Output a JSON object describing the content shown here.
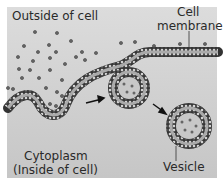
{
  "labels": {
    "outside": "Outside of cell",
    "membrane_line1": "Cell",
    "membrane_line2": "membrane",
    "cytoplasm_line1": "Cytoplasm",
    "cytoplasm_line2": "(Inside of cell)",
    "vesicle": "Vesicle"
  },
  "colors": {
    "background": "#c9c9c9",
    "outside_light": "#e0e0e0",
    "membrane_head": "#ffffff",
    "membrane_stroke": "#333333",
    "particle": "#555555",
    "arrow": "#111111"
  }
}
